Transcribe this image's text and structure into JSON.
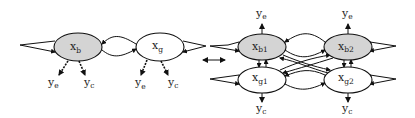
{
  "diagram": {
    "type": "graphical-model",
    "colors": {
      "shaded_fill": "#d4d4d4",
      "stroke": "#111111",
      "background": "#ffffff"
    },
    "left_model": {
      "nodes": [
        {
          "id": "xb",
          "base": "x",
          "sub": "b",
          "shaded": true
        },
        {
          "id": "xg",
          "base": "x",
          "sub": "g",
          "shaded": false
        }
      ],
      "outputs": [
        {
          "from": "xb",
          "base": "y",
          "sub": "e",
          "style": "dashed"
        },
        {
          "from": "xb",
          "base": "y",
          "sub": "c",
          "style": "dashed"
        },
        {
          "from": "xg",
          "base": "y",
          "sub": "e",
          "style": "dashed"
        },
        {
          "from": "xg",
          "base": "y",
          "sub": "c",
          "style": "dashed"
        }
      ],
      "edges": [
        "xb self-loop",
        "xg self-loop",
        "xb -> xg",
        "xg -> xb"
      ]
    },
    "equivalence_symbol": "double-arrow",
    "right_model": {
      "nodes": [
        {
          "id": "xb1",
          "base": "x",
          "sub": "b1",
          "shaded": true
        },
        {
          "id": "xb2",
          "base": "x",
          "sub": "b2",
          "shaded": true
        },
        {
          "id": "xg1",
          "base": "x",
          "sub": "g1",
          "shaded": false
        },
        {
          "id": "xg2",
          "base": "x",
          "sub": "g2",
          "shaded": false
        }
      ],
      "outputs": [
        {
          "from": "xb1",
          "base": "y",
          "sub": "e"
        },
        {
          "from": "xb2",
          "base": "y",
          "sub": "e"
        },
        {
          "from": "xg1",
          "base": "y",
          "sub": "c"
        },
        {
          "from": "xg2",
          "base": "y",
          "sub": "c"
        }
      ],
      "edges": [
        "self-loops on all nodes",
        "xb1 <-> xg1",
        "xb2 <-> xg2",
        "xb1 <-> xb2",
        "xg1 <-> xg2",
        "xb1 <-> xg2",
        "xg1 <-> xb2"
      ]
    }
  }
}
